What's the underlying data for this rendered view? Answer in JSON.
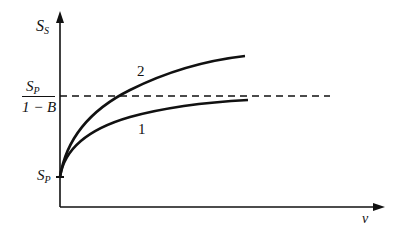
{
  "diagram": {
    "y_axis": {
      "label_main": "S",
      "label_sub": "S"
    },
    "x_axis": {
      "label": "v"
    },
    "start_label": {
      "main": "S",
      "sub": "P"
    },
    "asymptote_label": {
      "numerator_main": "S",
      "numerator_sub": "P",
      "denominator": "1 − B"
    },
    "curves": [
      {
        "id": "1",
        "label": "1"
      },
      {
        "id": "2",
        "label": "2"
      }
    ],
    "colors": {
      "stroke": "#111111",
      "background": "#ffffff"
    }
  }
}
